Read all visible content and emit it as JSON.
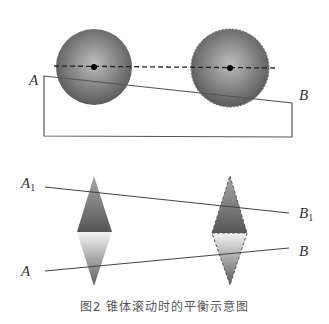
{
  "figure": {
    "caption": "图2 锥体滚动时的平衡示意图",
    "top_diagram": {
      "labels": {
        "a": "A",
        "b": "B"
      },
      "spheres": [
        {
          "name": "left-sphere",
          "cx": 94,
          "cy": 67,
          "r": 38,
          "outline": "solid"
        },
        {
          "name": "right-sphere",
          "cx": 230,
          "cy": 68,
          "r": 39,
          "outline": "dashed"
        }
      ],
      "colors": {
        "sphere_center": "#b9b9b9",
        "sphere_edge": "#5e5e5e",
        "line": "#555555"
      }
    },
    "bottom_diagram": {
      "labels": {
        "a1": "A",
        "a1_sub": "1",
        "b1": "B",
        "b1_sub": "1",
        "a": "A",
        "b": "B"
      },
      "colors": {
        "dark": "#6a6a6a",
        "light": "#f2f2f2",
        "line": "#444444"
      }
    }
  }
}
